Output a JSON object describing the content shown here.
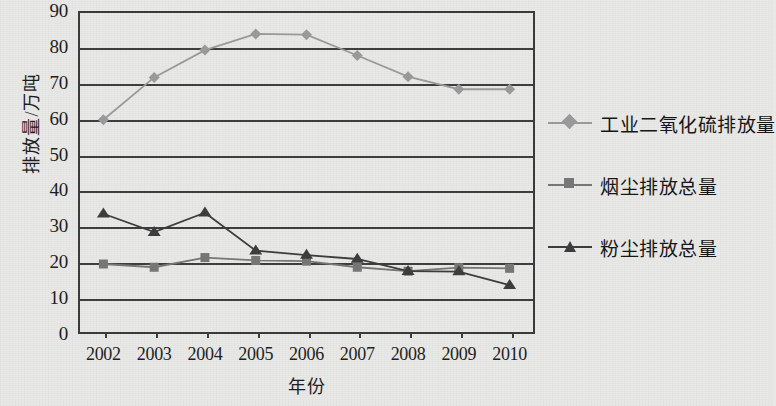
{
  "chart_data": {
    "type": "line",
    "title": "",
    "xlabel": "年份",
    "ylabel": "排放量/万吨",
    "categories": [
      "2002",
      "2003",
      "2004",
      "2005",
      "2006",
      "2007",
      "2008",
      "2009",
      "2010"
    ],
    "ylim": [
      0,
      90
    ],
    "ytick_step": 10,
    "yticks": [
      "0",
      "10",
      "20",
      "30",
      "40",
      "50",
      "60",
      "70",
      "80",
      "90"
    ],
    "grid": true,
    "legend_position": "right",
    "series": [
      {
        "name": "工业二氧化硫排放量",
        "marker": "diamond",
        "color": "#9a9a9a",
        "values": [
          59.7,
          71.5,
          79.1,
          83.6,
          83.4,
          77.6,
          71.7,
          68.2,
          68.2
        ]
      },
      {
        "name": "烟尘排放总量",
        "marker": "square",
        "color": "#767676",
        "values": [
          19.5,
          18.6,
          21.3,
          20.5,
          20.3,
          18.6,
          17.5,
          18.5,
          18.3
        ]
      },
      {
        "name": "粉尘排放总量",
        "marker": "triangle",
        "color": "#3c3c3c",
        "values": [
          33.5,
          28.4,
          33.8,
          23.2,
          22.0,
          20.9,
          17.5,
          17.4,
          13.6
        ]
      }
    ]
  },
  "colors": {
    "background": "#e8e8e6",
    "axis": "#3d3d3d",
    "text": "#1c1c1c",
    "series_so2": "#9a9a9a",
    "series_soot": "#767676",
    "series_dust": "#3c3c3c"
  }
}
